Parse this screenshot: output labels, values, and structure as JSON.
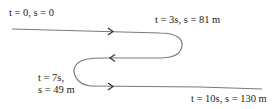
{
  "diagram": {
    "path_color": "#7a7a7a",
    "text_color": "#222222",
    "markers": [
      {
        "id": "start",
        "t_var": "t",
        "t_value": "0",
        "s_var": "s",
        "s_value": "0",
        "text": "t = 0, s = 0"
      },
      {
        "id": "turn1",
        "t_var": "t",
        "t_value": "3s",
        "s_var": "s",
        "s_value": "81 m",
        "text": "t = 3s, s = 81 m"
      },
      {
        "id": "turn2",
        "t_var": "t",
        "t_value": "7s,",
        "s_var": "s",
        "s_value": "49 m",
        "text_line1": "t = 7s,",
        "text_line2": "s = 49 m"
      },
      {
        "id": "end",
        "t_var": "t",
        "t_value": "10s",
        "s_var": "s",
        "s_value": "130 m",
        "text": "t = 10s, s = 130 m"
      }
    ],
    "arrows": [
      {
        "segment": "top",
        "direction": "right"
      },
      {
        "segment": "middle",
        "direction": "left"
      },
      {
        "segment": "bottom",
        "direction": "right"
      }
    ]
  }
}
